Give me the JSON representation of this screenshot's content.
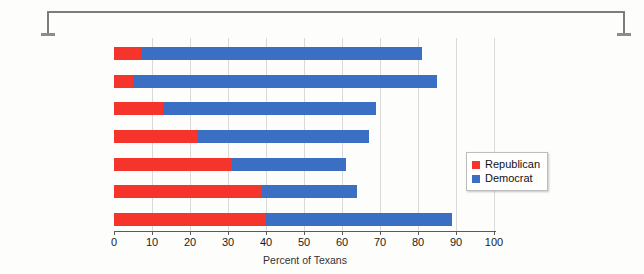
{
  "chart_data": {
    "type": "bar",
    "orientation": "horizontal",
    "stacked": true,
    "title": "",
    "xlabel": "Percent of Texans",
    "ylabel": "",
    "xlim": [
      0,
      100
    ],
    "ylim": null,
    "grid": true,
    "legend_position": "right-middle",
    "categories": [
      "1952",
      "1960",
      "1970",
      "1980",
      "1990",
      "2000",
      "2020"
    ],
    "xticks": [
      0,
      10,
      20,
      30,
      40,
      50,
      60,
      70,
      80,
      90,
      100
    ],
    "xtick_labels": [
      "0",
      "10",
      "20",
      "30",
      "40",
      "50",
      "60",
      "70",
      "80",
      "90",
      "100"
    ],
    "series": [
      {
        "name": "Republican",
        "color": "#f5352b",
        "values": [
          7,
          5,
          13,
          22,
          31,
          39,
          40
        ]
      },
      {
        "name": "Democrat",
        "color": "#3a6fc4",
        "values": [
          74,
          80,
          56,
          45,
          30,
          25,
          49
        ]
      }
    ],
    "totals": [
      81,
      85,
      69,
      67,
      61,
      64,
      89
    ]
  },
  "legend": {
    "items": [
      {
        "label": "Republican",
        "color": "#f5352b"
      },
      {
        "label": "Democrat",
        "color": "#3a6fc4"
      }
    ]
  }
}
